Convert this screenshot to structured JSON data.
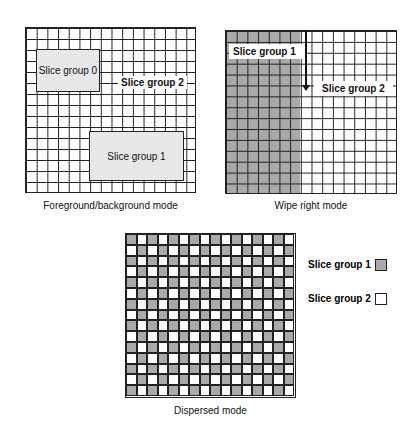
{
  "panels": {
    "foreground_background": {
      "caption": "Foreground/background mode",
      "slice_group_0": "Slice group 0",
      "slice_group_1": "Slice group 1",
      "slice_group_2": "Slice group 2"
    },
    "wipe_right": {
      "caption": "Wipe right mode",
      "slice_group_1": "Slice group 1",
      "slice_group_2": "Slice group 2"
    },
    "dispersed": {
      "caption": "Dispersed mode",
      "cols": 16,
      "rows": 15
    }
  },
  "legend": {
    "items": [
      {
        "label": "Slice group 1",
        "color": "#a9a9a9"
      },
      {
        "label": "Slice group 2",
        "color": "#ffffff"
      }
    ]
  },
  "colors": {
    "grid_line": "#222222",
    "fg_box": "#e8e8e8",
    "shaded": "#a9a9a9"
  }
}
